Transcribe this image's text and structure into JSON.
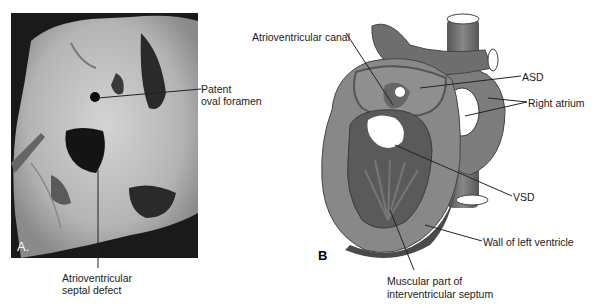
{
  "panel_a": {
    "letter": "A.",
    "kind": "photograph",
    "labels": {
      "patent_oval_foramen_line1": "Patent",
      "patent_oval_foramen_line2": "oval foramen",
      "av_septal_defect_line1": "Atrioventricular",
      "av_septal_defect_line2": "septal defect"
    }
  },
  "panel_b": {
    "letter": "B",
    "kind": "illustration",
    "labels": {
      "av_canal": "Atrioventricular canal",
      "asd": "ASD",
      "right_atrium": "Right atrium",
      "vsd": "VSD",
      "wall_lv": "Wall of left ventricle",
      "muscular_septum_line1": "Muscular part of",
      "muscular_septum_line2": "interventricular septum"
    }
  },
  "colors": {
    "tissue_dark": "#555555",
    "tissue_mid": "#7a7a7a",
    "tissue_light": "#9a9a9a",
    "photo_bg": "#1a1a1a",
    "photo_tissue": "#c8c8c8"
  }
}
